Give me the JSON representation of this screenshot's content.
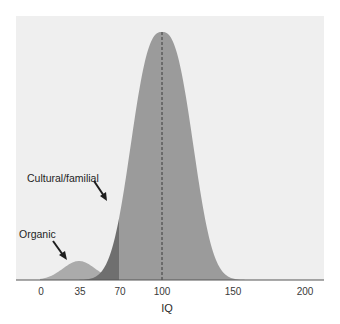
{
  "chart_data": {
    "type": "area",
    "title": "",
    "xlabel": "IQ",
    "ylabel": "",
    "xlim": [
      0,
      200
    ],
    "grid": false,
    "legend": null,
    "x_ticks": [
      {
        "label": "0",
        "px": 41
      },
      {
        "label": "35",
        "px": 80
      },
      {
        "label": "70",
        "px": 120
      },
      {
        "label": "100",
        "px": 162
      },
      {
        "label": "150",
        "px": 233
      },
      {
        "label": "200",
        "px": 305
      }
    ],
    "series": [
      {
        "name": "Normal IQ distribution",
        "shape": "bell curve",
        "center_iq": 100,
        "color": "#9b9b9b",
        "peak_marker": "dashed vertical line at IQ 100"
      },
      {
        "name": "Cultural/familial",
        "description": "left tail of main distribution below IQ 70",
        "range_iq": [
          null,
          70
        ],
        "color": "#6f6f6f"
      },
      {
        "name": "Organic",
        "description": "small secondary bump centered near IQ 35",
        "center_iq": 35,
        "color": "#ababab"
      }
    ],
    "annotations": [
      {
        "text": "Cultural/familial",
        "arrow_to": "dark left-tail region near IQ 60"
      },
      {
        "text": "Organic",
        "arrow_to": "small bump near IQ 30"
      }
    ]
  },
  "colors": {
    "plot_bg": "#efefef",
    "main": "#9b9b9b",
    "cultural": "#6f6f6f",
    "organic": "#ababab",
    "axis": "#555555",
    "dash": "#3a3a3a"
  }
}
